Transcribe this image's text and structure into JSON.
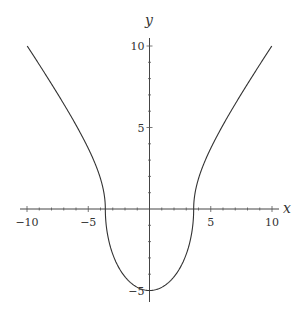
{
  "chart_data": {
    "type": "line",
    "title": "",
    "xlabel": "x",
    "ylabel": "y",
    "xlim": [
      -10,
      10
    ],
    "ylim": [
      -5.2,
      10.5
    ],
    "grid": false,
    "x_ticks": [
      -10,
      -5,
      5,
      10
    ],
    "x_tick_labels": [
      "−10",
      "−5",
      "5",
      "10"
    ],
    "y_ticks": [
      10,
      5,
      -5
    ],
    "y_tick_labels": [
      "10",
      "5",
      "−5"
    ],
    "series": [
      {
        "name": "curve",
        "color": "#333333",
        "description": "Upper hyperbola branches x^2/13 - y^2/15 = 1 for y>=0, joined with lower semi-ellipse x^2/13 + y^2/25 = 1 for y<=0",
        "points": [
          [
            -10,
            10.0
          ],
          [
            -9,
            9.0
          ],
          [
            -8,
            7.9
          ],
          [
            -7,
            6.7
          ],
          [
            -6,
            5.5
          ],
          [
            -5,
            4.0
          ],
          [
            -4.5,
            3.1
          ],
          [
            -4,
            2.1
          ],
          [
            -3.7,
            1.0
          ],
          [
            -3.6,
            0
          ],
          [
            -3.5,
            -1.3
          ],
          [
            -3,
            -2.8
          ],
          [
            -2,
            -4.2
          ],
          [
            -1,
            -4.8
          ],
          [
            0,
            -5.0
          ],
          [
            1,
            -4.8
          ],
          [
            2,
            -4.2
          ],
          [
            3,
            -2.8
          ],
          [
            3.5,
            -1.3
          ],
          [
            3.6,
            0
          ],
          [
            3.7,
            1.0
          ],
          [
            4,
            2.1
          ],
          [
            4.5,
            3.1
          ],
          [
            5,
            4.0
          ],
          [
            6,
            5.5
          ],
          [
            7,
            6.7
          ],
          [
            8,
            7.9
          ],
          [
            9,
            9.0
          ],
          [
            10,
            10.0
          ]
        ]
      }
    ]
  },
  "axes": {
    "x_name": "x",
    "y_name": "y"
  }
}
